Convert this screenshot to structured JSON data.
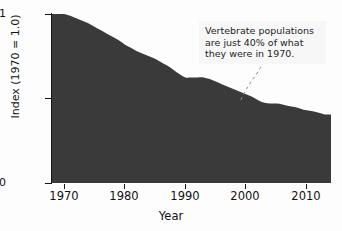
{
  "chart_data": {
    "type": "area",
    "title": "",
    "subtitle": "",
    "xlabel": "Year",
    "ylabel": "Index (1970 = 1.0)",
    "xlim": [
      1968,
      2014
    ],
    "ylim": [
      0,
      1
    ],
    "grid": false,
    "legend": "none",
    "series_name": "Living Planet Index (vertebrate populations)",
    "fill_color": "#3a3a3a",
    "background_color": "#fdfdfd",
    "axis_color": "#171717",
    "x_ticks": [
      1970,
      1980,
      1990,
      2000,
      2010
    ],
    "x_tick_labels": [
      "1970",
      "1980",
      "1990",
      "2000",
      "2010"
    ],
    "y_ticks": [
      0,
      0.5,
      1
    ],
    "y_tick_labels": [
      "0",
      "",
      "1"
    ],
    "x": [
      1970,
      1971,
      1972,
      1973,
      1974,
      1975,
      1976,
      1977,
      1978,
      1979,
      1980,
      1981,
      1982,
      1983,
      1984,
      1985,
      1986,
      1987,
      1988,
      1989,
      1990,
      1991,
      1992,
      1993,
      1994,
      1995,
      1996,
      1997,
      1998,
      1999,
      2000,
      2001,
      2002,
      2003,
      2004,
      2005,
      2006,
      2007,
      2008,
      2009,
      2010,
      2011,
      2012,
      2013
    ],
    "values": [
      1.0,
      0.99,
      0.975,
      0.96,
      0.945,
      0.925,
      0.905,
      0.885,
      0.865,
      0.845,
      0.82,
      0.8,
      0.78,
      0.765,
      0.75,
      0.735,
      0.715,
      0.695,
      0.67,
      0.645,
      0.625,
      0.625,
      0.625,
      0.625,
      0.615,
      0.6,
      0.585,
      0.57,
      0.555,
      0.54,
      0.525,
      0.51,
      0.49,
      0.475,
      0.47,
      0.47,
      0.465,
      0.455,
      0.45,
      0.44,
      0.43,
      0.425,
      0.415,
      0.405
    ],
    "annotations": [
      {
        "id": "vertebrate-callout",
        "lines": [
          "Vertebrate populations",
          "are just 40% of what",
          "they were in 1970."
        ],
        "points_to_year": 2004,
        "points_to_value": 0.47,
        "leader_style": "dashed"
      }
    ]
  },
  "axes": {
    "y_title": "Index (1970 = 1.0)",
    "x_title": "Year",
    "y_labels": {
      "top": "1",
      "bottom": "0"
    }
  }
}
